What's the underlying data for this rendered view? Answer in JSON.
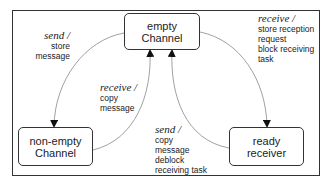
{
  "diagram": {
    "nodes": [
      {
        "id": "empty",
        "line1": "empty",
        "line2": "Channel"
      },
      {
        "id": "nonempty",
        "line1": "non-empty",
        "line2": "Channel"
      },
      {
        "id": "ready",
        "line1": "ready",
        "line2": "receiver"
      }
    ],
    "transitions": [
      {
        "from": "empty",
        "to": "nonempty",
        "event": "send /",
        "actions": [
          "store",
          "message"
        ]
      },
      {
        "from": "nonempty",
        "to": "empty",
        "event": "receive /",
        "actions": [
          "copy",
          "message"
        ]
      },
      {
        "from": "empty",
        "to": "ready",
        "event": "receive /",
        "actions": [
          "store reception",
          "request",
          "block receiving",
          "task"
        ]
      },
      {
        "from": "ready",
        "to": "empty",
        "event": "send /",
        "actions": [
          "copy",
          "message",
          "deblock",
          "receiving task"
        ]
      }
    ],
    "colors": {
      "stroke": "#333333",
      "edge": "#888888",
      "background": "#ffffff"
    }
  }
}
